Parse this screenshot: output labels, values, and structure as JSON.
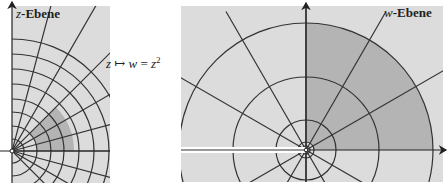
{
  "diagram": {
    "left_panel": {
      "label_var": "z",
      "label_word": "-Ebene",
      "background": "#dcdcdc",
      "shade_color": "#b4b4b4",
      "arc_radii": [
        12,
        25,
        39,
        52,
        67,
        82,
        97,
        112
      ],
      "ray_angles_deg": [
        -45,
        -30,
        -15,
        0,
        15,
        30,
        45,
        60,
        75
      ],
      "shaded_region": {
        "r_min": 25,
        "r_max": 62,
        "angle_min_deg": 0,
        "angle_max_deg": 45
      }
    },
    "mapping": {
      "lhs": "z",
      "arrow": "↦",
      "rhs_var": "w",
      "equals": "=",
      "rhs_expr": "z",
      "exponent": "2"
    },
    "right_panel": {
      "label_var": "w",
      "label_word": "-Ebene",
      "background": "#dcdcdc",
      "shade_color": "#b4b4b4",
      "circle_radii": [
        4,
        8,
        30,
        73,
        127
      ],
      "ray_angles_deg": [
        -150,
        -120,
        -90,
        -60,
        -30,
        30,
        60,
        90,
        120,
        150
      ],
      "shaded_region": {
        "r_min": 8,
        "r_max": 127,
        "angle_min_deg": 0,
        "angle_max_deg": 90
      },
      "branch_cut": "negative real axis"
    }
  }
}
